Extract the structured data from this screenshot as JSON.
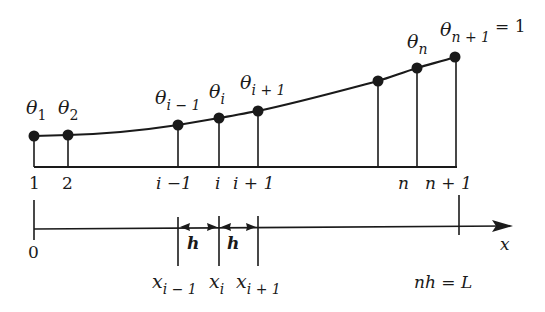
{
  "diagram": {
    "type": "finite-difference-grid",
    "colors": {
      "ink": "#1a1a1a",
      "background": "#ffffff"
    },
    "curve": {
      "nodes": [
        {
          "id": "node-1",
          "x": 34,
          "y": 136,
          "theta_sym": "θ",
          "theta_sub": "1",
          "index_label": "1"
        },
        {
          "id": "node-2",
          "x": 68,
          "y": 135,
          "theta_sym": "θ",
          "theta_sub": "2",
          "index_label": "2"
        },
        {
          "id": "node-i-minus-1",
          "x": 178,
          "y": 125,
          "theta_sym": "θ",
          "theta_sub": "i − 1",
          "index_label": "i −1"
        },
        {
          "id": "node-i",
          "x": 219,
          "y": 118,
          "theta_sym": "θ",
          "theta_sub": "i",
          "index_label": "i"
        },
        {
          "id": "node-i-plus-1",
          "x": 258,
          "y": 111,
          "theta_sym": "θ",
          "theta_sub": "i + 1",
          "index_label": "i + 1"
        },
        {
          "id": "node-unlabeled",
          "x": 378,
          "y": 81,
          "theta_sym": "",
          "theta_sub": "",
          "index_label": ""
        },
        {
          "id": "node-n",
          "x": 417,
          "y": 68,
          "theta_sym": "θ",
          "theta_sub": "n",
          "index_label": "n"
        },
        {
          "id": "node-n-plus-1",
          "x": 455,
          "y": 57,
          "theta_sym": "θ",
          "theta_sub": "n + 1",
          "index_label": "n + 1"
        }
      ],
      "boundary_value": "= 1",
      "baseline_y": 167
    },
    "axis": {
      "origin_label": "0",
      "axis_label": "x",
      "spacing_label": "h",
      "length_label": "nh = L",
      "x_labels": [
        {
          "sym": "x",
          "sub": "i − 1"
        },
        {
          "sym": "x",
          "sub": "i"
        },
        {
          "sym": "x",
          "sub": "i + 1"
        }
      ]
    }
  }
}
